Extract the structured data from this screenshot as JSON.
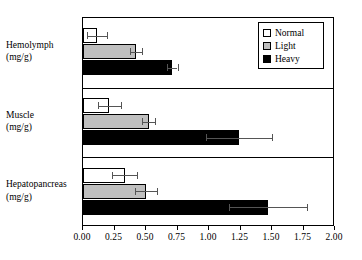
{
  "chart_data": {
    "type": "bar",
    "orientation": "horizontal",
    "title": "",
    "xlabel": "",
    "ylabel": "",
    "xlim": [
      0.0,
      2.0
    ],
    "xticks": [
      "0.00",
      "0.25",
      "0.50",
      "0.75",
      "1.00",
      "1.25",
      "1.50",
      "1.75",
      "2.00"
    ],
    "xtick_values": [
      0.0,
      0.25,
      0.5,
      0.75,
      1.0,
      1.25,
      1.5,
      1.75,
      2.0
    ],
    "grid": false,
    "legend_position": "top-right",
    "categories": [
      "Hemolymph",
      "Muscle",
      "Hepatopancreas"
    ],
    "category_units": [
      "(mg/g)",
      "(mg/g)",
      "(mg/g)"
    ],
    "series": [
      {
        "name": "Normal",
        "color": "#ffffff",
        "values": [
          0.11,
          0.21,
          0.33
        ],
        "errors": [
          0.08,
          0.09,
          0.1
        ]
      },
      {
        "name": "Light",
        "color": "#bfbfbf",
        "values": [
          0.42,
          0.52,
          0.5
        ],
        "errors": [
          0.05,
          0.05,
          0.09
        ]
      },
      {
        "name": "Heavy",
        "color": "#000000",
        "values": [
          0.71,
          1.24,
          1.47
        ],
        "errors": [
          0.04,
          0.26,
          0.31
        ]
      }
    ]
  },
  "legend": {
    "items": [
      {
        "label": "Normal",
        "swatch": "normal"
      },
      {
        "label": "Light",
        "swatch": "light"
      },
      {
        "label": "Heavy",
        "swatch": "heavy"
      }
    ]
  },
  "axis": {
    "y_categories": [
      {
        "name": "Hemolymph",
        "unit": "(mg/g)"
      },
      {
        "name": "Muscle",
        "unit": "(mg/g)"
      },
      {
        "name": "Hepatopancreas",
        "unit": "(mg/g)"
      }
    ]
  }
}
